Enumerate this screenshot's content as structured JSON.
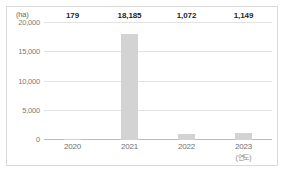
{
  "chart_data": {
    "type": "bar",
    "title": "",
    "subtitle": "",
    "unit_label": "(ha)",
    "xlabel": "(연도)",
    "ylabel": "",
    "categories": [
      "2020",
      "2021",
      "2022",
      "2023"
    ],
    "values": [
      179,
      18185,
      1072,
      1149
    ],
    "value_labels": [
      "179",
      "18,185",
      "1,072",
      "1,149"
    ],
    "category_sublabels": [
      "",
      "",
      "",
      "(연도)"
    ],
    "ylim": [
      0,
      20000
    ],
    "yticks": [
      0,
      5000,
      10000,
      15000,
      20000
    ],
    "ytick_labels": [
      "0",
      "5,000",
      "10,000",
      "15,000",
      "20,000"
    ],
    "grid": true,
    "legend": false,
    "legend_position": "none",
    "colors": {
      "bar": "#d3d3d3",
      "gridline": "#e2e2e2",
      "baseline": "#bdbdbd",
      "frame": "#d9d9d9",
      "value_label": "#1f1f1f",
      "tick_label": "#7a7a7a",
      "background": "#ffffff"
    }
  }
}
